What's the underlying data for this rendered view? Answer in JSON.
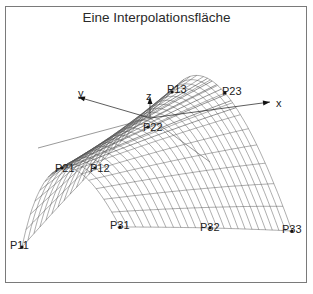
{
  "figure": {
    "title": "Eine Interpolationsfläche",
    "axes": {
      "origin": [
        150,
        118
      ],
      "x": {
        "label": "x",
        "end": [
          270,
          102
        ],
        "label_pos": [
          276,
          107
        ]
      },
      "y": {
        "label": "y",
        "end": [
          78,
          97
        ],
        "label_pos": [
          78,
          97
        ]
      },
      "z": {
        "label": "z",
        "end": [
          150,
          97
        ],
        "label_pos": [
          146,
          100
        ]
      },
      "extension_left": [
        38,
        148
      ],
      "extension_down": [
        210,
        162
      ]
    },
    "surface": {
      "grid_u": 16,
      "grid_v": 24,
      "mesh_color": "#555555",
      "control_points": [
        [
          [
            22,
            247
          ],
          [
            95,
            168
          ],
          [
            172,
            92
          ]
        ],
        [
          [
            62,
            168
          ],
          [
            148,
            127
          ],
          [
            225,
            93
          ]
        ],
        [
          [
            120,
            227
          ],
          [
            210,
            228
          ],
          [
            292,
            231
          ]
        ]
      ]
    },
    "points": [
      {
        "name": "P11",
        "dot": [
          22,
          247
        ],
        "label": "P11",
        "label_pos": [
          10,
          249
        ]
      },
      {
        "name": "P12",
        "dot": [
          95,
          168
        ],
        "label": "P12",
        "label_pos": [
          90,
          172
        ]
      },
      {
        "name": "P13",
        "dot": [
          172,
          92
        ],
        "label": "P13",
        "label_pos": [
          167,
          93
        ]
      },
      {
        "name": "P21",
        "dot": [
          62,
          168
        ],
        "label": "P21",
        "label_pos": [
          55,
          172
        ]
      },
      {
        "name": "P22",
        "dot": [
          148,
          127
        ],
        "label": "P22",
        "label_pos": [
          143,
          131
        ]
      },
      {
        "name": "P23",
        "dot": [
          225,
          93
        ],
        "label": "P23",
        "label_pos": [
          222,
          95
        ]
      },
      {
        "name": "P31",
        "dot": [
          120,
          227
        ],
        "label": "P31",
        "label_pos": [
          110,
          229
        ]
      },
      {
        "name": "P32",
        "dot": [
          210,
          228
        ],
        "label": "P32",
        "label_pos": [
          200,
          231
        ]
      },
      {
        "name": "P33",
        "dot": [
          292,
          231
        ],
        "label": "P33",
        "label_pos": [
          282,
          233
        ]
      }
    ]
  }
}
